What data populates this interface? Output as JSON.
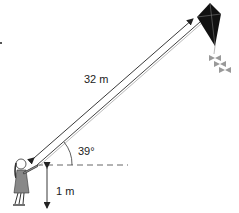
{
  "labels": {
    "string_length": "32 m",
    "angle": "39°",
    "hand_height": "1 m"
  },
  "figure": {
    "string_length_m": 32,
    "angle_of_elevation_deg": 39,
    "height_of_hand_m": 1
  },
  "colors": {
    "line": "#333333",
    "kite": "#111111",
    "tail": "#999999",
    "girl": "#777777",
    "dashed": "#666666"
  }
}
